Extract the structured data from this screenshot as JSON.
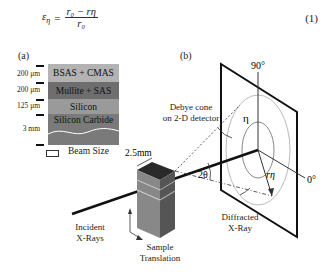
{
  "equation": {
    "lhs": "ε",
    "lhs_sub": "η",
    "numerator": "r₀ − rη",
    "denominator": "r₀",
    "number": "(1)"
  },
  "panel_a": {
    "label": "(a)",
    "layers": [
      {
        "name": "BSAS + CMAS",
        "thickness": "200 μm",
        "color": "#b3b3b3"
      },
      {
        "name": "Mullite + SAS",
        "thickness": "200 μm",
        "color": "#6e6e6e"
      },
      {
        "name": "Silicon",
        "thickness": "125 μm",
        "color": "#9a9a9a"
      },
      {
        "name": "Silicon Carbide",
        "thickness": "3 mm",
        "color": "#7a7a7a"
      }
    ],
    "legend": "Beam Size"
  },
  "panel_b": {
    "label": "(b)",
    "labels": {
      "angle_90": "90°",
      "angle_0": "0°",
      "debye_cone": "Debye cone",
      "debye_cone_2": "on 2-D detector",
      "eta": "η",
      "r_eta": "rη",
      "two_theta": "2θ",
      "width": "2.5mm",
      "incident": "Incident",
      "incident_2": "X-Rays",
      "diffracted": "Diffracted",
      "diffracted_2": "X-Ray",
      "sample": "Sample",
      "sample_2": "Translation"
    }
  }
}
